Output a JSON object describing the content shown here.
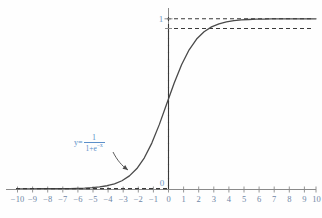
{
  "figure": {
    "name": "sigmoid-function-plot",
    "colors": {
      "curve": "#4a4a4a",
      "axis": "#8a8a8a",
      "dashed": "#3a3a3a",
      "tick_text": "#6f86a6",
      "label_blue": "#5b8fc9"
    }
  },
  "labels": {
    "y_one": "1",
    "y_zero": "0",
    "formula_lhs": "y=",
    "formula_numerator": "1",
    "formula_denominator_base": "1+e",
    "formula_denominator_exponent": "−x"
  },
  "chart_data": {
    "type": "line",
    "title": "",
    "xlabel": "",
    "ylabel": "",
    "xlim": [
      -10.8,
      10.8
    ],
    "ylim": [
      -0.12,
      1.22
    ],
    "grid": false,
    "legend": "none",
    "function": "y = 1 / (1 + e^(-x))",
    "annotations": [
      {
        "text": "y = 1/(1+e^-x)",
        "x": -3.0,
        "y": 0.23,
        "color": "#5b8fc9",
        "arrow_to": {
          "x": -1.85,
          "y": 0.1
        }
      },
      {
        "text": "1",
        "x": -0.55,
        "y": 1.0,
        "color": "#6f97c4"
      },
      {
        "text": "0",
        "x": -0.55,
        "y": 0.075,
        "color": "#6f97c4"
      }
    ],
    "asymptotes": [
      {
        "type": "horizontal",
        "y": 1,
        "style": "dashed",
        "x_from": -0.05,
        "x_to": 10.4
      },
      {
        "type": "horizontal",
        "y": 0,
        "style": "dashed",
        "x_from": -10.4,
        "x_to": 0.0
      },
      {
        "type": "vertical",
        "x": 0,
        "style": "dashed",
        "y_from": 0,
        "y_to": 1
      }
    ],
    "xticks": [
      -10,
      -9,
      -8,
      -7,
      -6,
      -5,
      -4,
      -3,
      -2,
      -1,
      0,
      1,
      2,
      3,
      4,
      5,
      6,
      7,
      8,
      9,
      10
    ],
    "xticklabels": [
      "−10",
      "−9",
      "−8",
      "−7",
      "−6",
      "−5",
      "−4",
      "−3",
      "−2",
      "−1",
      "0",
      "1",
      "2",
      "3",
      "4",
      "5",
      "6",
      "7",
      "8",
      "9",
      "10"
    ],
    "yticks": [
      0,
      1
    ],
    "yticklabels": [
      "0",
      "1"
    ],
    "x": [
      -10,
      -9.5,
      -9,
      -8.5,
      -8,
      -7.5,
      -7,
      -6.5,
      -6,
      -5.5,
      -5,
      -4.5,
      -4,
      -3.5,
      -3,
      -2.5,
      -2,
      -1.5,
      -1,
      -0.5,
      0,
      0.5,
      1,
      1.5,
      2,
      2.5,
      3,
      3.5,
      4,
      4.5,
      5,
      5.5,
      6,
      6.5,
      7,
      7.5,
      8,
      8.5,
      9,
      9.5,
      10
    ],
    "y": [
      4.54e-05,
      7.49e-05,
      0.0001234,
      0.0002034,
      0.000335,
      0.000553,
      0.000911,
      0.0015,
      0.00247,
      0.00407,
      0.00669,
      0.011,
      0.018,
      0.0293,
      0.0474,
      0.0759,
      0.1192,
      0.1824,
      0.2689,
      0.3775,
      0.5,
      0.6225,
      0.7311,
      0.8176,
      0.8808,
      0.9241,
      0.9526,
      0.9707,
      0.982,
      0.989,
      0.9933,
      0.9959,
      0.9975,
      0.9985,
      0.9991,
      0.9994,
      0.99966,
      0.9998,
      0.99988,
      0.99993,
      0.99995
    ]
  }
}
